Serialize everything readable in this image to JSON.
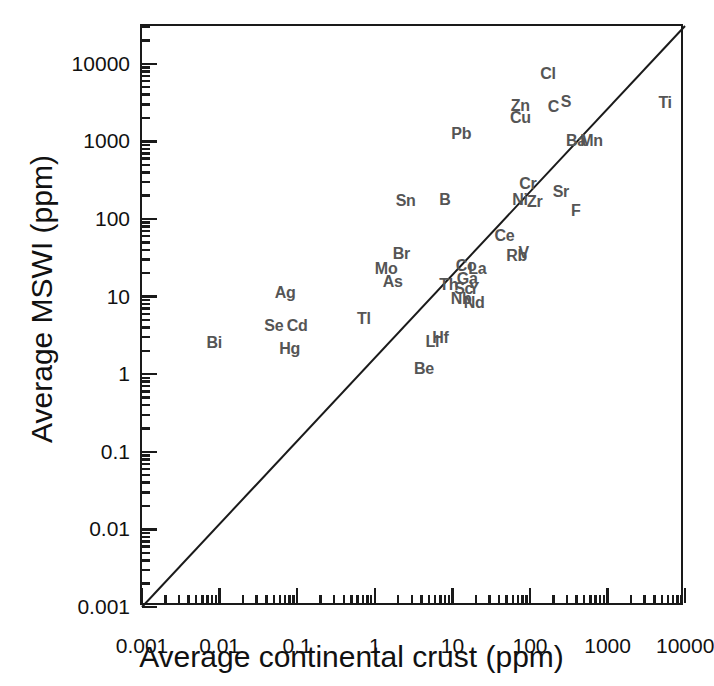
{
  "figure": {
    "background": "#ffffff",
    "frame_color": "#1a1a1a",
    "label_color": "#555555"
  },
  "chart_data": {
    "type": "scatter",
    "title": "",
    "xlabel": "Average continental crust (ppm)",
    "ylabel": "Average MSWI (ppm)",
    "xscale": "log",
    "yscale": "log",
    "xlim": [
      0.001,
      30000
    ],
    "ylim": [
      0.001,
      30000
    ],
    "grid": false,
    "legend": null,
    "xticks": [
      "0.001",
      "0.01",
      "0.1",
      "1",
      "10",
      "100",
      "1000",
      "10000"
    ],
    "yticks": [
      "0.001",
      "0.01",
      "0.1",
      "1",
      "10",
      "100",
      "1000",
      "10000"
    ],
    "xtick_values": [
      0.001,
      0.01,
      0.1,
      1,
      10,
      100,
      1000,
      10000
    ],
    "ytick_values": [
      0.001,
      0.01,
      0.1,
      1,
      10,
      100,
      1000,
      10000
    ],
    "reference_line": {
      "name": "1:1 line",
      "from": [
        0.001,
        0.001
      ],
      "to": [
        30000,
        30000
      ],
      "color": "#1a1a1a"
    },
    "point_label_style": "element-symbol",
    "points": [
      {
        "label": "Bi",
        "x": 0.0085,
        "y": 2.5
      },
      {
        "label": "Se",
        "x": 0.05,
        "y": 4.2
      },
      {
        "label": "Hg",
        "x": 0.08,
        "y": 2.1
      },
      {
        "label": "Cd",
        "x": 0.1,
        "y": 4.2
      },
      {
        "label": "Ag",
        "x": 0.07,
        "y": 11.0
      },
      {
        "label": "Tl",
        "x": 0.72,
        "y": 5.2
      },
      {
        "label": "Mo",
        "x": 1.4,
        "y": 23.0
      },
      {
        "label": "As",
        "x": 1.7,
        "y": 15.5
      },
      {
        "label": "Br",
        "x": 2.2,
        "y": 35.0
      },
      {
        "label": "Sn",
        "x": 2.5,
        "y": 170.0
      },
      {
        "label": "B",
        "x": 8.0,
        "y": 175.0
      },
      {
        "label": "Be",
        "x": 4.3,
        "y": 1.15
      },
      {
        "label": "Li",
        "x": 5.5,
        "y": 2.6
      },
      {
        "label": "Hf",
        "x": 7.0,
        "y": 2.9
      },
      {
        "label": "Pb",
        "x": 13.0,
        "y": 1250.0
      },
      {
        "label": "Th",
        "x": 9.0,
        "y": 14.0
      },
      {
        "label": "Nb",
        "x": 13.0,
        "y": 9.2
      },
      {
        "label": "Nd",
        "x": 19.0,
        "y": 8.2
      },
      {
        "label": "Sc",
        "x": 14.0,
        "y": 12.5
      },
      {
        "label": "Y",
        "x": 19.0,
        "y": 12.5
      },
      {
        "label": "Ga",
        "x": 15.5,
        "y": 17.0
      },
      {
        "label": "Co",
        "x": 15.0,
        "y": 25.0
      },
      {
        "label": "La",
        "x": 21.0,
        "y": 23.0
      },
      {
        "label": "Ce",
        "x": 47.0,
        "y": 60.0
      },
      {
        "label": "Rb",
        "x": 67.0,
        "y": 33.0
      },
      {
        "label": "V",
        "x": 83.0,
        "y": 37.0
      },
      {
        "label": "Cr",
        "x": 94.0,
        "y": 280.0
      },
      {
        "label": "Ni",
        "x": 74.0,
        "y": 175.0
      },
      {
        "label": "Zr",
        "x": 115.0,
        "y": 165.0
      },
      {
        "label": "Sr",
        "x": 250.0,
        "y": 220.0
      },
      {
        "label": "F",
        "x": 390.0,
        "y": 125.0
      },
      {
        "label": "Zn",
        "x": 75.0,
        "y": 2900.0
      },
      {
        "label": "Cu",
        "x": 75.0,
        "y": 2000.0
      },
      {
        "label": "Cl",
        "x": 170.0,
        "y": 7400.0
      },
      {
        "label": "C",
        "x": 200.0,
        "y": 2800.0
      },
      {
        "label": "S",
        "x": 290.0,
        "y": 3200.0
      },
      {
        "label": "Ba",
        "x": 390.0,
        "y": 1000.0
      },
      {
        "label": "Mn",
        "x": 620.0,
        "y": 1000.0
      },
      {
        "label": "Ti",
        "x": 5500.0,
        "y": 3100.0
      }
    ]
  }
}
